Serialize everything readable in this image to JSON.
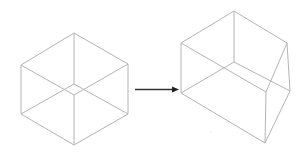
{
  "diagram": {
    "colors": {
      "edge": "#b4b4b4",
      "arrow": "#333333",
      "background": "#ffffff"
    },
    "left_cube": {
      "vertices": {
        "top": [
          74,
          33
        ],
        "left_top": [
          21,
          65
        ],
        "right_top": [
          128,
          64
        ],
        "left_bottom": [
          21,
          114
        ],
        "right_bottom": [
          128,
          114
        ],
        "bottom": [
          74,
          145
        ],
        "inner_front": [
          74,
          95
        ],
        "inner_back": [
          74,
          84
        ]
      }
    },
    "arrow": {
      "from": [
        135,
        89
      ],
      "to": [
        178,
        89
      ]
    },
    "right_shape": {
      "vertices": {
        "top": [
          234,
          11
        ],
        "left_top": [
          181,
          43
        ],
        "right_top": [
          287,
          43
        ],
        "left_bottom": [
          181,
          93
        ],
        "back_bottom": [
          234,
          62
        ],
        "front_top": [
          266,
          92
        ],
        "right_bottom": [
          290,
          91
        ],
        "bottom": [
          265,
          143
        ]
      }
    }
  }
}
